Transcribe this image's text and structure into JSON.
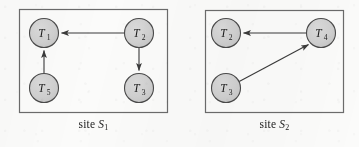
{
  "figure": {
    "name": "two-site-transaction-wait-for-graphs",
    "background_color": "#fbfbfa",
    "node_fill_color": "#cfcfcf",
    "node_stroke_color": "#4a4a4a",
    "edge_color": "#3a3a3a",
    "frame_color": "#6b6b6b",
    "text_color": "#1b1b1b"
  },
  "sites": [
    {
      "id": "site-1",
      "caption_prefix": "site",
      "caption_symbol": "S",
      "caption_subscript": "1",
      "frame": {
        "x": 19,
        "y": 9,
        "width": 149,
        "height": 104
      },
      "nodes": [
        {
          "id": "s1-t1",
          "label": "T",
          "subscript": "1",
          "cx": 44,
          "cy": 33,
          "r": 14.5
        },
        {
          "id": "s1-t2",
          "label": "T",
          "subscript": "2",
          "cx": 139,
          "cy": 33,
          "r": 14.5
        },
        {
          "id": "s1-t5",
          "label": "T",
          "subscript": "5",
          "cx": 44,
          "cy": 88,
          "r": 14.5
        },
        {
          "id": "s1-t3",
          "label": "T",
          "subscript": "3",
          "cx": 139,
          "cy": 88,
          "r": 14.5
        }
      ],
      "edges": [
        {
          "id": "s1-e1",
          "from": "s1-t2",
          "to": "s1-t1",
          "direction": "right-to-left",
          "label": "T2 waits for T1"
        },
        {
          "id": "s1-e2",
          "from": "s1-t5",
          "to": "s1-t1",
          "direction": "bottom-to-top",
          "label": "T5 waits for T1"
        },
        {
          "id": "s1-e3",
          "from": "s1-t2",
          "to": "s1-t3",
          "direction": "top-to-bottom",
          "label": "T2 waits for T3"
        }
      ]
    },
    {
      "id": "site-2",
      "caption_prefix": "site",
      "caption_symbol": "S",
      "caption_subscript": "2",
      "frame": {
        "x": 205,
        "y": 10,
        "width": 139,
        "height": 103
      },
      "nodes": [
        {
          "id": "s2-t2",
          "label": "T",
          "subscript": "2",
          "cx": 226,
          "cy": 33,
          "r": 14.5
        },
        {
          "id": "s2-t4",
          "label": "T",
          "subscript": "4",
          "cx": 321,
          "cy": 33,
          "r": 14.5
        },
        {
          "id": "s2-t3",
          "label": "T",
          "subscript": "3",
          "cx": 226,
          "cy": 88,
          "r": 14.5
        }
      ],
      "edges": [
        {
          "id": "s2-e1",
          "from": "s2-t4",
          "to": "s2-t2",
          "direction": "right-to-left",
          "label": "T4 waits for T2"
        },
        {
          "id": "s2-e2",
          "from": "s2-t3",
          "to": "s2-t4",
          "direction": "diagonal-up-right",
          "label": "T3 waits for T4"
        }
      ]
    }
  ]
}
